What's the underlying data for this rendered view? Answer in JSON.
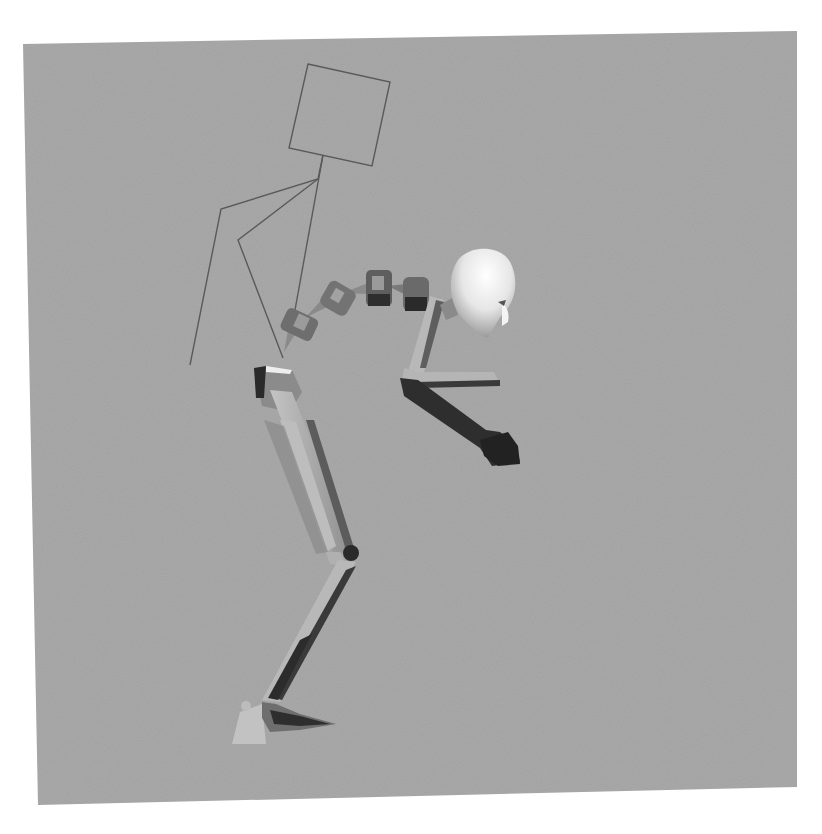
{
  "image": {
    "description": "Grayscale 3D render of an articulated character rig bent forward, with an IK control handle drawn as thin lines",
    "background_color": "#ffffff",
    "viewport_color": "#a9a9a9"
  },
  "viewport": {
    "corners": {
      "top_left": [
        23,
        44
      ],
      "top_right": [
        797,
        31
      ],
      "bottom_right": [
        797,
        787
      ],
      "bottom_left": [
        38,
        805
      ]
    }
  },
  "figure": {
    "parts": [
      "ik-control-square",
      "ik-control-lines",
      "spine-vertebrae",
      "head",
      "upper-arm",
      "forearm",
      "hand",
      "dark-arm",
      "pelvis",
      "thigh",
      "knee",
      "shin",
      "foot"
    ]
  }
}
